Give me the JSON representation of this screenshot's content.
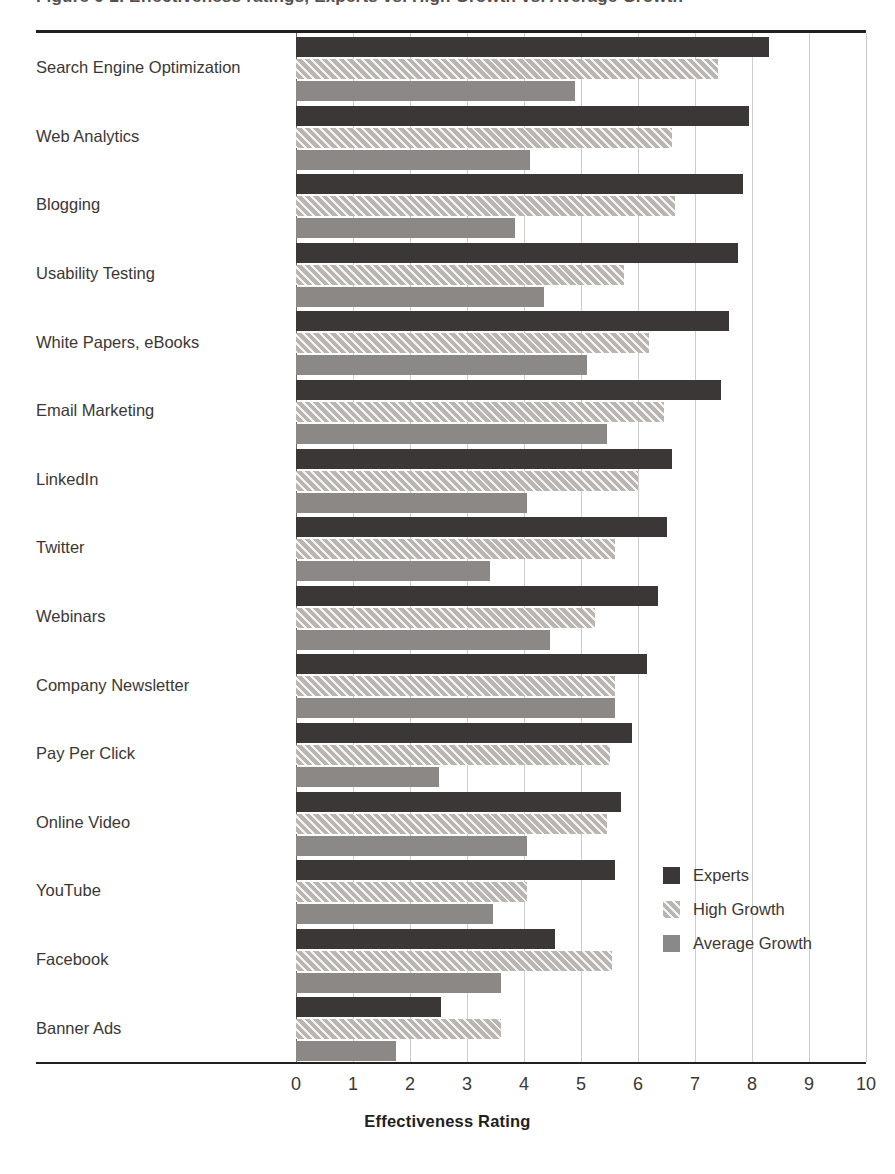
{
  "figure": {
    "clipped_title": "Figure 6-2. Effectiveness ratings, Experts vs. High Growth vs. Average Growth"
  },
  "legend": {
    "position": "bottom-right",
    "entries": [
      {
        "label": "Experts",
        "swatch": "dark-solid-swatch",
        "color": "#3a3736"
      },
      {
        "label": "High Growth",
        "swatch": "hatched-swatch",
        "color": "#b9b6b2"
      },
      {
        "label": "Average Growth",
        "swatch": "gray-solid-swatch",
        "color": "#8b8885"
      }
    ]
  },
  "axis": {
    "x_title": "Effectiveness Rating",
    "x_ticks": [
      "0",
      "1",
      "2",
      "3",
      "4",
      "5",
      "6",
      "7",
      "8",
      "9",
      "10"
    ]
  },
  "chart_data": {
    "type": "bar",
    "orientation": "horizontal",
    "title": "",
    "xlabel": "Effectiveness Rating",
    "ylabel": "",
    "xlim": [
      0,
      10
    ],
    "grid": true,
    "legend_position": "bottom-right",
    "categories": [
      "Search Engine Optimization",
      "Web Analytics",
      "Blogging",
      "Usability Testing",
      "White Papers, eBooks",
      "Email Marketing",
      "LinkedIn",
      "Twitter",
      "Webinars",
      "Company Newsletter",
      "Pay Per Click",
      "Online Video",
      "YouTube",
      "Facebook",
      "Banner Ads"
    ],
    "series": [
      {
        "name": "Experts",
        "color": "#3a3736",
        "values": [
          8.3,
          7.95,
          7.85,
          7.75,
          7.6,
          7.45,
          6.6,
          6.5,
          6.35,
          6.15,
          5.9,
          5.7,
          5.6,
          4.55,
          2.55
        ]
      },
      {
        "name": "High Growth",
        "color": "#b9b6b2",
        "values": [
          7.4,
          6.6,
          6.65,
          5.75,
          6.2,
          6.45,
          6.0,
          5.6,
          5.25,
          5.6,
          5.5,
          5.45,
          4.05,
          5.55,
          3.6
        ]
      },
      {
        "name": "Average Growth",
        "color": "#8b8885",
        "values": [
          4.9,
          4.1,
          3.85,
          4.35,
          5.1,
          5.45,
          4.05,
          3.4,
          4.45,
          5.6,
          2.5,
          4.05,
          3.45,
          3.6,
          1.75
        ]
      }
    ]
  }
}
